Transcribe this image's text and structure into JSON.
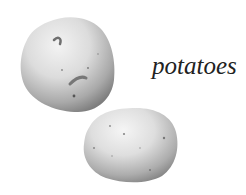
{
  "image": {
    "description": "Illustration of two potatoes with a caption",
    "label": "potatoes",
    "items": [
      {
        "name": "potato",
        "position": "upper-left"
      },
      {
        "name": "potato",
        "position": "lower-center"
      }
    ],
    "colors": {
      "background": "#ffffff",
      "text": "#222222",
      "potato_light": "#ececec",
      "potato_mid": "#c8c8c8",
      "potato_dark": "#8a8a8a"
    }
  }
}
